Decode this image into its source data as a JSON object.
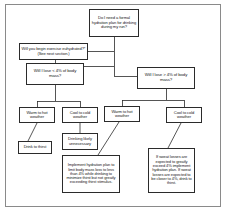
{
  "diagram": {
    "background_color": "#ffffff",
    "frame_color": "#8a8a8a",
    "node_border_color": "#2b2b2b",
    "text_color": "#1a1a1a"
  },
  "nodes": {
    "root_question": "Do I need a formal hydration plan for drinking during my run?",
    "euhydrated_question": "Will you begin exercise euhydrated?* (See next section.)",
    "loss_less_than_4": "Will I lose < 4% of body mass?",
    "loss_greater_than_4": "Will I lose > 4% of body mass?",
    "warm_hot_left": "Warm to hot weather",
    "cool_cold_left": "Cool to cold weather",
    "warm_hot_right": "Warm to hot weather",
    "cool_cold_right": "Cool to cold weather",
    "drink_to_thirst": "Drink to thirst",
    "drinking_unnecessary": "Drinking likely unnecessary",
    "implement_plan": "Implement hydration plan to limit body mass loss to less than 4% while drinking to minimize thirst but not greatly exceeding thirst stimulus.",
    "sweat_losses": "If sweat losses are expected to greatly exceed 4% implement hydration plan. If sweat losses are expected to be closer to 4%, drink to thirst."
  }
}
